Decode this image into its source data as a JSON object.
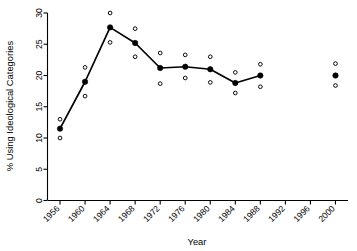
{
  "chart_data": {
    "type": "line",
    "title": "",
    "subtitle": "",
    "xlabel": "Year",
    "ylabel": "% Using Ideological Categories",
    "xlim": [
      1954,
      2002
    ],
    "ylim": [
      0,
      30
    ],
    "yticks": [
      0,
      5,
      10,
      15,
      20,
      25,
      30
    ],
    "ytick_labels": [
      "0",
      "5",
      "10",
      "15",
      "20",
      "25",
      "30"
    ],
    "xticks": [
      1956,
      1960,
      1964,
      1968,
      1972,
      1976,
      1980,
      1984,
      1988,
      1992,
      1996,
      2000
    ],
    "xtick_labels": [
      "1956",
      "1960",
      "1964",
      "1968",
      "1972",
      "1976",
      "1980",
      "1984",
      "1988",
      "1992",
      "1996",
      "2000"
    ],
    "grid": false,
    "legend": "none",
    "x": [
      1956,
      1960,
      1964,
      1968,
      1972,
      1976,
      1980,
      1984,
      1988,
      2000
    ],
    "series": [
      {
        "name": "% Using Ideological Categories",
        "marker": "filled-circle",
        "connected_through": [
          1956,
          1960,
          1964,
          1968,
          1972,
          1976,
          1980,
          1984,
          1988
        ],
        "values": [
          11.5,
          19.0,
          27.7,
          25.2,
          21.2,
          21.4,
          21.0,
          18.8,
          20.0,
          20.0
        ]
      },
      {
        "name": "Upper confidence bound",
        "marker": "open-circle",
        "values": [
          13.0,
          21.3,
          30.0,
          27.5,
          23.6,
          23.3,
          23.0,
          20.5,
          21.8,
          21.9
        ]
      },
      {
        "name": "Lower confidence bound",
        "marker": "open-circle",
        "values": [
          10.0,
          16.7,
          25.3,
          23.0,
          18.7,
          19.6,
          18.9,
          17.2,
          18.2,
          18.4
        ]
      }
    ]
  },
  "axes": {
    "x_title": "Year",
    "y_title": "% Using Ideological Categories"
  }
}
